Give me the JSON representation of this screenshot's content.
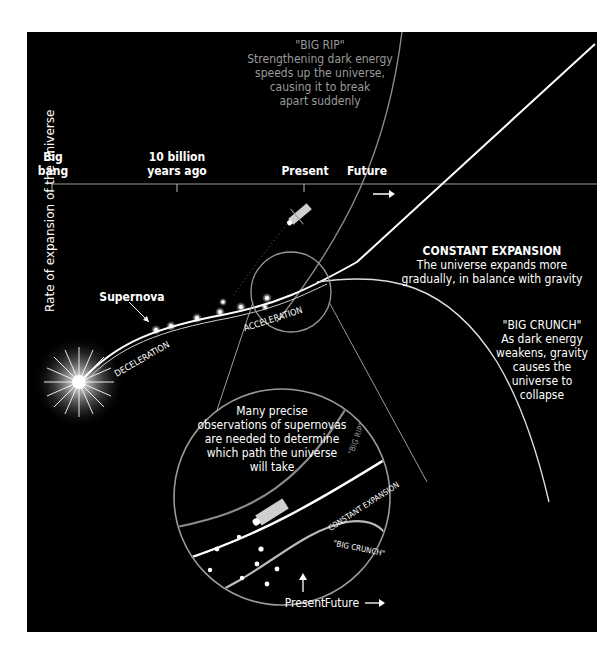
{
  "diagram": {
    "title": "Expansion of the universe",
    "y_axis_label": "Rate of expansion of the universe",
    "timeline": {
      "ticks": [
        {
          "label_line1": "Big",
          "label_line2": "bang"
        },
        {
          "label_line1": "10 billion",
          "label_line2": "years ago"
        },
        {
          "label_line1": "Present",
          "label_line2": ""
        },
        {
          "label_line1": "Future",
          "label_line2": ""
        }
      ]
    },
    "supernova_label": "Supernova",
    "deceleration_label": "DECELERATION",
    "acceleration_label": "ACCELERATION",
    "scenarios": {
      "big_rip": {
        "title": "\"BIG RIP\"",
        "lines": [
          "Strengthening dark energy",
          "speeds up the universe,",
          "causing it to break",
          "apart suddenly"
        ]
      },
      "constant_expansion": {
        "title": "CONSTANT EXPANSION",
        "lines": [
          "The universe expands more",
          "gradually, in balance with gravity"
        ]
      },
      "big_crunch": {
        "title": "\"BIG CRUNCH\"",
        "lines": [
          "As dark energy",
          "weakens, gravity",
          "causes the",
          "universe to",
          "collapse"
        ]
      }
    },
    "inset": {
      "caption_lines": [
        "Many precise",
        "observations of supernovas",
        "are needed to determine",
        "which path the universe",
        "will take"
      ],
      "curve_labels": {
        "big_rip": "\"BIG RIP\"",
        "constant_expansion": "CONSTANT EXPANSION",
        "big_crunch": "\"BIG CRUNCH\""
      },
      "present_label": "Present",
      "future_label": "Future"
    },
    "colors": {
      "background": "#000000",
      "line": "#ffffff",
      "dim_line": "#8a8a8a",
      "dim_text": "#9a9a9a"
    }
  }
}
